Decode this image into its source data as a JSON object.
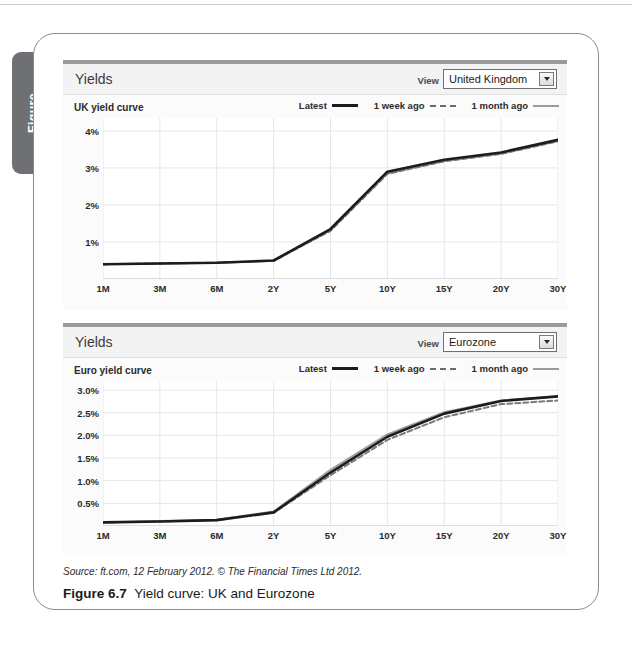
{
  "side_tab": {
    "label": "Figure"
  },
  "panels": [
    {
      "id": "uk",
      "title": "Yields",
      "view_label": "View",
      "selected_region": "United Kingdom",
      "dropdown_icon": "chevron-down-icon",
      "subtitle": "UK yield curve",
      "legend": [
        {
          "label": "Latest",
          "style": "solid-thick",
          "color": "#1c1c1c"
        },
        {
          "label": "1 week ago",
          "style": "dashed",
          "color": "#6b6b6b"
        },
        {
          "label": "1 month ago",
          "style": "solid-thin",
          "color": "#9b9b9b"
        }
      ]
    },
    {
      "id": "eu",
      "title": "Yields",
      "view_label": "View",
      "selected_region": "Eurozone",
      "dropdown_icon": "chevron-down-icon",
      "subtitle": "Euro yield curve",
      "legend": [
        {
          "label": "Latest",
          "style": "solid-thick",
          "color": "#1c1c1c"
        },
        {
          "label": "1 week ago",
          "style": "dashed",
          "color": "#6b6b6b"
        },
        {
          "label": "1 month ago",
          "style": "solid-thin",
          "color": "#9b9b9b"
        }
      ]
    }
  ],
  "source_note": "Source: ft.com, 12 February 2012. © The Financial Times Ltd 2012.",
  "caption": {
    "number": "Figure 6.7",
    "text": "Yield curve: UK and Eurozone"
  },
  "chart_data": [
    {
      "type": "line",
      "title": "UK yield curve",
      "xlabel": "",
      "ylabel": "",
      "x": [
        "1M",
        "3M",
        "6M",
        "2Y",
        "5Y",
        "10Y",
        "15Y",
        "20Y",
        "30Y"
      ],
      "ytick_labels": [
        "1%",
        "2%",
        "3%",
        "4%"
      ],
      "yticks": [
        1,
        2,
        3,
        4
      ],
      "ylim": [
        0,
        4.35
      ],
      "grid": true,
      "legend_position": "top-right",
      "series": [
        {
          "name": "Latest",
          "values": [
            0.4,
            0.42,
            0.44,
            0.5,
            1.35,
            2.9,
            3.22,
            3.42,
            3.76
          ]
        },
        {
          "name": "1 week ago",
          "values": [
            0.4,
            0.42,
            0.44,
            0.49,
            1.3,
            2.84,
            3.18,
            3.38,
            3.72
          ]
        },
        {
          "name": "1 month ago",
          "values": [
            0.4,
            0.42,
            0.44,
            0.49,
            1.32,
            2.86,
            3.19,
            3.39,
            3.73
          ]
        }
      ]
    },
    {
      "type": "line",
      "title": "Euro yield curve",
      "xlabel": "",
      "ylabel": "",
      "x": [
        "1M",
        "3M",
        "6M",
        "2Y",
        "5Y",
        "10Y",
        "15Y",
        "20Y",
        "30Y"
      ],
      "ytick_labels": [
        "0.5%",
        "1.0%",
        "1.5%",
        "2.0%",
        "2.5%",
        "3.0%"
      ],
      "yticks": [
        0.5,
        1.0,
        1.5,
        2.0,
        2.5,
        3.0
      ],
      "ylim": [
        0,
        3.2
      ],
      "grid": true,
      "legend_position": "top-right",
      "series": [
        {
          "name": "Latest",
          "values": [
            0.08,
            0.1,
            0.13,
            0.3,
            1.18,
            1.97,
            2.48,
            2.76,
            2.86
          ]
        },
        {
          "name": "1 week ago",
          "values": [
            0.08,
            0.1,
            0.13,
            0.29,
            1.12,
            1.9,
            2.4,
            2.69,
            2.77
          ]
        },
        {
          "name": "1 month ago",
          "values": [
            0.08,
            0.11,
            0.14,
            0.32,
            1.24,
            2.02,
            2.51,
            2.77,
            2.86
          ]
        }
      ]
    }
  ]
}
